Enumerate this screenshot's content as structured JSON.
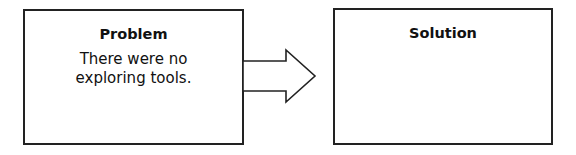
{
  "diagram": {
    "problem": {
      "title": "Problem",
      "lines": [
        "There were no",
        "exploring tools."
      ]
    },
    "connector": {
      "type": "block-arrow",
      "direction": "right"
    },
    "solution": {
      "title": "Solution",
      "lines": []
    }
  },
  "colors": {
    "stroke": "#222222",
    "background": "#ffffff",
    "text": "#111111"
  }
}
